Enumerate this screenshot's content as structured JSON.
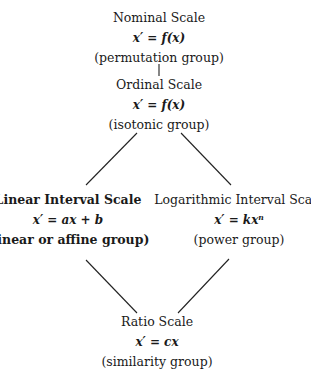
{
  "diagram": {
    "nodes": {
      "nominal": {
        "title": "Nominal Scale",
        "formula": "x′ = f(x)",
        "group": "(permutation group)"
      },
      "ordinal": {
        "title": "Ordinal Scale",
        "formula": "x′ = f(x)",
        "group": "(isotonic group)"
      },
      "linear_interval": {
        "title": "Linear Interval Scale",
        "formula": "x′ = ax + b",
        "group": "(linear or affine group)"
      },
      "log_interval": {
        "title": "Logarithmic Interval Scale",
        "formula": "x′ = kxⁿ",
        "group": "(power group)"
      },
      "ratio": {
        "title": "Ratio Scale",
        "formula": "x′ = cx",
        "group": "(similarity group)"
      }
    },
    "edges": [
      {
        "from": "nominal",
        "to": "ordinal"
      },
      {
        "from": "ordinal",
        "to": "linear_interval"
      },
      {
        "from": "ordinal",
        "to": "log_interval"
      },
      {
        "from": "linear_interval",
        "to": "ratio"
      },
      {
        "from": "log_interval",
        "to": "ratio"
      }
    ]
  }
}
